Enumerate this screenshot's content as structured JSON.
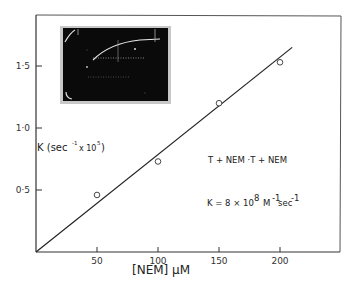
{
  "chart_data": {
    "type": "scatter",
    "title": "",
    "xlabel": "[NEM] μM",
    "ylabel": "K (sec⁻¹ × 10⁵)",
    "xlim": [
      0,
      250
    ],
    "ylim": [
      0,
      1.9
    ],
    "grid": false,
    "x_ticks": [
      50,
      100,
      150,
      200
    ],
    "x_tick_labels": [
      "50",
      "100",
      "150",
      "200"
    ],
    "y_ticks": [
      0.5,
      1.0,
      1.5
    ],
    "y_tick_labels": [
      "0·5",
      "1·0",
      "1·5"
    ],
    "series": [
      {
        "name": "observed K",
        "marker": "open-circle",
        "x": [
          50,
          100,
          150,
          200
        ],
        "y": [
          0.46,
          0.73,
          1.2,
          1.53
        ]
      },
      {
        "name": "linear fit",
        "type": "line",
        "x": [
          0,
          210
        ],
        "y": [
          0,
          1.65
        ]
      }
    ],
    "annotations": [
      "T + NEM → T + NEM",
      "K = 8 × 10⁸ M⁻¹ sec⁻¹"
    ],
    "inset": {
      "description": "oscilloscope trace photograph showing exponential rise to plateau"
    }
  },
  "labels": {
    "ylabel_main": "K (sec",
    "ylabel_exp1": "-1",
    "ylabel_mid": "x 10",
    "ylabel_exp2": "5",
    "ylabel_close": ")",
    "xlabel": "[NEM]  μM",
    "reaction": "T  + NEM  ·T + NEM",
    "rate_prefix": "K = 8 × 10",
    "rate_exp": "8",
    "rate_unit1": "M",
    "rate_unit1_exp": "-1",
    "rate_unit2": "sec",
    "rate_unit2_exp": "-1"
  }
}
